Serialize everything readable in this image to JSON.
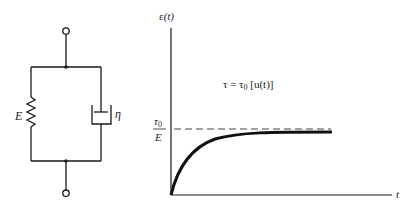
{
  "circuit": {
    "type": "Kelvin-Voigt model (spring and dashpot in parallel)",
    "spring_label": "E",
    "dashpot_label": "η"
  },
  "graph": {
    "y_axis_label_symbol": "ε",
    "y_axis_label_arg": "(t)",
    "x_axis_label": "t",
    "asymptote_numerator": "τ",
    "asymptote_numerator_sub": "0",
    "asymptote_denominator": "E",
    "equation": {
      "lhs": "τ = τ",
      "sub": "0",
      "rhs": " [u(t)]"
    }
  },
  "colors": {
    "line": "#1a1a1a",
    "dash": "#444444",
    "background": "#ffffff"
  }
}
